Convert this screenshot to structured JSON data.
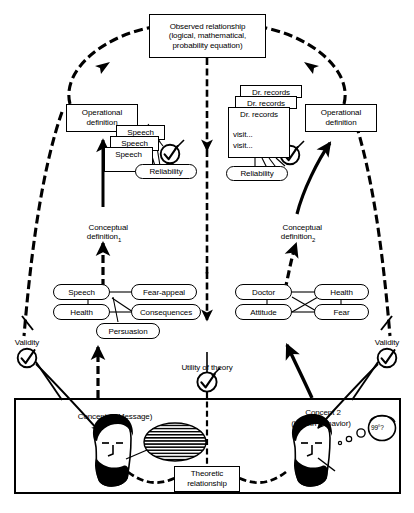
{
  "diagram": {
    "title_top": "Observed relationship\n(logical, mathematical,\nprobability equation)",
    "operational_definition_left": "Operational\ndefinition",
    "operational_definition_right": "Operational\ndefinition",
    "conceptual_definition_left": "Conceptual\ndefinition",
    "conceptual_definition_left_sub": "1",
    "conceptual_definition_right": "Conceptual\ndefinition",
    "conceptual_definition_right_sub": "2",
    "reliability_left": "Reliability",
    "reliability_right": "Reliability",
    "validity_left": "Validity",
    "validity_right": "Validity",
    "utility_of_theory": "Utility of theory",
    "theoretic_relationship": "Theoretic\nrelationship",
    "concept_1": "Concept 1 (Message)",
    "concept_2_line1": "Concept 2",
    "concept_2_line2": "(Health behavior)",
    "temperature_note": "99°?"
  },
  "speech_cards": [
    {
      "label": "Speech"
    },
    {
      "label": "Speech"
    },
    {
      "label": "Speech"
    }
  ],
  "record_cards": [
    {
      "label": "Dr. records"
    },
    {
      "label": "Dr. records"
    },
    {
      "label": "Dr. records",
      "line2": "visit...",
      "line3": "visit..."
    }
  ],
  "concept_nodes_left": [
    {
      "label": "Speech"
    },
    {
      "label": "Health"
    },
    {
      "label": "Fear-appeal"
    },
    {
      "label": "Consequences"
    },
    {
      "label": "Persuasion"
    }
  ],
  "concept_nodes_right": [
    {
      "label": "Doctor"
    },
    {
      "label": "Health"
    },
    {
      "label": "Attitude"
    },
    {
      "label": "Fear"
    }
  ],
  "icons": {
    "check_mark": "check-circle-icon",
    "person_head": "person-head-icon",
    "speech_balloon": "hatched-speech-balloon-icon"
  },
  "colors": {
    "ink": "#000000",
    "paper": "#ffffff"
  }
}
